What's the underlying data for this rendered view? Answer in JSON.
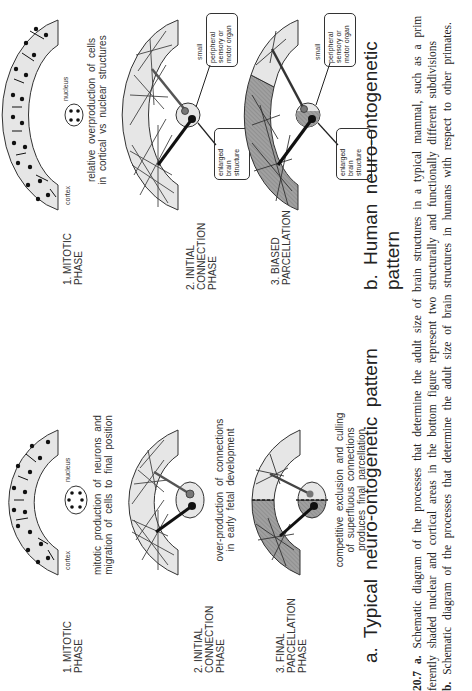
{
  "figure": {
    "number": "20.7",
    "panels": [
      {
        "id": "a",
        "title": "a.  Typical  neuro-ontogenetic  pattern",
        "phases": [
          {
            "label_line1": "1. MITOTIC",
            "label_line2": "PHASE",
            "label_line3": "",
            "diagram_labels": {
              "cortex": "cortex",
              "nucleus": "nucleus"
            },
            "desc_line1": "mitotic production of neurons and",
            "desc_line2": "migration of cells to final position",
            "desc_line3": ""
          },
          {
            "label_line1": "2.  INITIAL",
            "label_line2": "CONNECTION",
            "label_line3": "PHASE",
            "desc_line1": "over-production of connections",
            "desc_line2": "in early fetal development",
            "desc_line3": ""
          },
          {
            "label_line1": "3.  FINAL",
            "label_line2": "PARCELLATION",
            "label_line3": "PHASE",
            "desc_line1": "competitive exclusion and culling",
            "desc_line2": "of superfluous connections",
            "desc_line3": "produces final parcellation"
          }
        ]
      },
      {
        "id": "b",
        "title": "b.  Human  neuro-ontogenetic  pattern",
        "phases": [
          {
            "label_line1": "1. MITOTIC",
            "label_line2": "PHASE",
            "label_line3": "",
            "diagram_labels": {
              "cortex": "cortex",
              "nucleus": "nucleus"
            },
            "desc_line1": "relative overproduction of cells",
            "desc_line2": "in cortical vs nuclear structures",
            "desc_line3": ""
          },
          {
            "label_line1": "2.  INITIAL",
            "label_line2": "CONNECTION",
            "label_line3": "PHASE",
            "diagram_labels": {
              "small": "small",
              "peripheral_line1": "peripheral",
              "peripheral_line2": "sensory or",
              "peripheral_line3": "motor organ",
              "enlarged_line1": "enlarged",
              "enlarged_line2": "brain",
              "enlarged_line3": "structure"
            },
            "desc_line1": "",
            "desc_line2": "",
            "desc_line3": ""
          },
          {
            "label_line1": "3.  BIASED",
            "label_line2": "PARCELLATION",
            "label_line3": "",
            "diagram_labels": {
              "small": "small",
              "peripheral_line1": "peripheral",
              "peripheral_line2": "sensory or",
              "peripheral_line3": "motor organ",
              "enlarged_line1": "enlarged",
              "enlarged_line2": "brain",
              "enlarged_line3": "structure"
            },
            "desc_line1": "",
            "desc_line2": "",
            "desc_line3": ""
          }
        ]
      }
    ],
    "caption": {
      "line1_bold": "20.7 a.",
      "line1": " Schematic diagram of the processes that determine the adult size of brain structures in a typical mammal, such as a prim",
      "line2": "ferently shaded nuclear and cortical areas in the bottom figure represent two structurally and functionally different subdivisions",
      "line3_bold": "b.",
      "line3": " Schematic diagram of the processes that determine the adult size of brain structures in humans with respect to other primates.",
      "line4": "                                                                                                                               "
    },
    "colors": {
      "cortex_fill": "#e6e6e6",
      "dark_region_fill": "#9a9a9a",
      "stroke": "#333333",
      "background": "#ffffff"
    }
  }
}
